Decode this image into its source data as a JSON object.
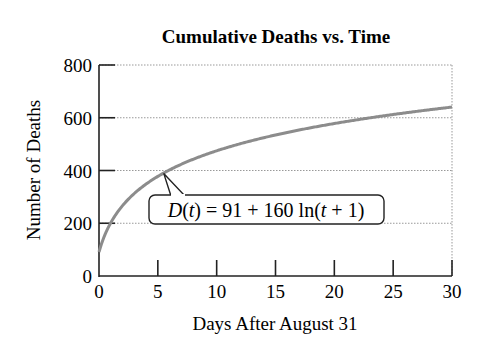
{
  "chart_data": {
    "type": "line",
    "title": "Cumulative Deaths vs. Time",
    "xlabel": "Days After August 31",
    "ylabel": "Number of Deaths",
    "xlim": [
      0,
      30
    ],
    "ylim": [
      0,
      800
    ],
    "xticks": [
      0,
      5,
      10,
      15,
      20,
      25,
      30
    ],
    "yticks": [
      0,
      200,
      400,
      600,
      800
    ],
    "grid": "horizontal dotted",
    "function": "D(t) = 91 + 160 ln(t + 1)",
    "series": [
      {
        "name": "D(t)",
        "x": [
          0,
          1,
          2,
          3,
          4,
          5,
          6,
          8,
          10,
          12,
          15,
          18,
          20,
          22,
          25,
          28,
          30
        ],
        "values": [
          91,
          202,
          267,
          313,
          349,
          378,
          402,
          443,
          475,
          501,
          535,
          562,
          578,
          593,
          612,
          630,
          640
        ]
      }
    ],
    "annotation": {
      "text_parts": [
        "D",
        "(",
        "t",
        ") = 91 + 160 ln(",
        "t",
        " + 1)"
      ],
      "points_to": [
        5.5,
        389
      ]
    }
  }
}
